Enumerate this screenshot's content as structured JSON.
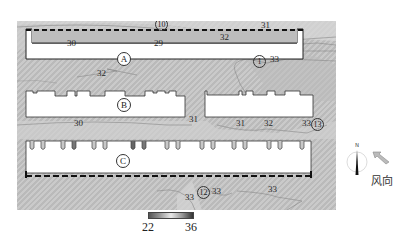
{
  "map": {
    "background_color": "#c4c4c4",
    "buildings": [
      {
        "id": "A",
        "label": "A"
      },
      {
        "id": "B",
        "label": "B"
      },
      {
        "id": "C",
        "label": "C"
      }
    ],
    "isotherm_labels": [
      {
        "text": "30",
        "x": 67,
        "y": 40
      },
      {
        "text": "29",
        "x": 154,
        "y": 40
      },
      {
        "text": "32",
        "x": 97,
        "y": 70
      },
      {
        "text": "31",
        "x": 261,
        "y": 22
      },
      {
        "text": "32",
        "x": 220,
        "y": 34
      },
      {
        "text": "33",
        "x": 270,
        "y": 56
      },
      {
        "text": "31",
        "x": 189,
        "y": 116
      },
      {
        "text": "30",
        "x": 74,
        "y": 120
      },
      {
        "text": "31",
        "x": 236,
        "y": 120
      },
      {
        "text": "32",
        "x": 264,
        "y": 120
      },
      {
        "text": "33",
        "x": 302,
        "y": 120
      },
      {
        "text": "33",
        "x": 185,
        "y": 194
      },
      {
        "text": "33",
        "x": 212,
        "y": 188
      },
      {
        "text": "33",
        "x": 268,
        "y": 186
      }
    ],
    "point_markers": [
      {
        "text": "10",
        "x": 155,
        "y": 19
      },
      {
        "text": "1",
        "x": 253,
        "y": 56
      },
      {
        "text": "13",
        "x": 311,
        "y": 119
      },
      {
        "text": "12",
        "x": 197,
        "y": 187
      }
    ]
  },
  "legend": {
    "min_label": "22",
    "max_label": "36"
  },
  "compass": {
    "north_label": "N"
  },
  "wind": {
    "label": "风向"
  }
}
